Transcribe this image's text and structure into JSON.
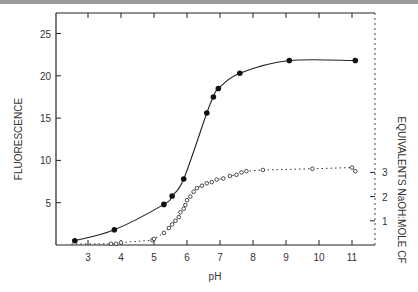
{
  "chart_data": {
    "type": "line",
    "title": "",
    "xlabel": "pH",
    "ylabel": "FLUORESCENCE",
    "y2label": "EQUIVALENTS NaOH:MOLE CF",
    "xlim": [
      2,
      11.7
    ],
    "ylim": [
      0,
      27
    ],
    "y2lim": [
      0,
      3.5
    ],
    "x_ticks": [
      "3",
      "4",
      "5",
      "6",
      "7",
      "8",
      "9",
      "10",
      "11"
    ],
    "y_ticks": [
      "5",
      "10",
      "15",
      "20",
      "25"
    ],
    "y2_ticks": [
      "1",
      "2",
      "3"
    ],
    "grid": false,
    "series": [
      {
        "name": "Fluorescence",
        "marker": "filled-circle",
        "line": "solid",
        "axis": "left",
        "x": [
          2.6,
          3.8,
          5.3,
          5.55,
          5.9,
          6.6,
          6.8,
          6.95,
          7.6,
          9.1,
          11.1
        ],
        "y": [
          0.5,
          1.8,
          4.8,
          5.8,
          7.8,
          15.6,
          17.5,
          18.5,
          20.3,
          21.8,
          21.8
        ]
      },
      {
        "name": "Equivalents NaOH:mole CF",
        "marker": "open-circle",
        "line": "dotted",
        "axis": "right",
        "x": [
          3.7,
          3.85,
          4.0,
          4.95,
          5.0,
          5.3,
          5.45,
          5.55,
          5.65,
          5.75,
          5.8,
          5.9,
          5.95,
          6.0,
          6.1,
          6.2,
          6.3,
          6.45,
          6.6,
          6.75,
          6.9,
          7.1,
          7.3,
          7.5,
          7.65,
          7.8,
          8.3,
          9.8,
          11.0,
          11.1
        ],
        "y": [
          0.05,
          0.05,
          0.1,
          0.2,
          0.25,
          0.5,
          0.7,
          0.85,
          1.0,
          1.15,
          1.35,
          1.5,
          1.65,
          1.85,
          2.0,
          2.2,
          2.35,
          2.45,
          2.55,
          2.6,
          2.7,
          2.75,
          2.85,
          2.9,
          3.0,
          3.05,
          3.1,
          3.15,
          3.2,
          3.05
        ]
      }
    ]
  }
}
